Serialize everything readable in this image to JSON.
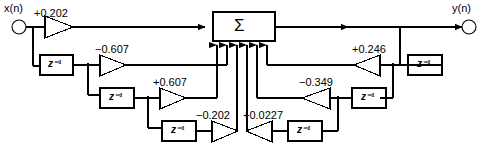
{
  "diagram": {
    "type": "signal-flow-graph",
    "stroke_color": "#000000",
    "background": "#ffffff",
    "summation_symbol": "Σ",
    "delay_label": "z⁻¹",
    "input_label": "x(n)",
    "output_label": "y(n)",
    "feedforward_coefficients": [
      "+0.202",
      "-0.607",
      "+0.607",
      "-0.202"
    ],
    "feedback_coefficients": [
      "+0.246",
      "-0.349",
      "+0.0227"
    ],
    "summation_input_count": 7,
    "delay_count": 6
  },
  "nodes": {
    "input": {
      "name": "x(n)",
      "label": "x(n)"
    },
    "output": {
      "name": "y(n)",
      "label": "y(n)"
    },
    "adder": {
      "label": "Σ"
    }
  },
  "gains": [
    {
      "id": "g1",
      "label": "+0.202",
      "value": 0.202,
      "direction": "right",
      "path": "feedforward"
    },
    {
      "id": "g2",
      "label": "−0.607",
      "value": -0.607,
      "direction": "right",
      "path": "feedforward"
    },
    {
      "id": "g3",
      "label": "+0.607",
      "value": 0.607,
      "direction": "right",
      "path": "feedforward"
    },
    {
      "id": "g4",
      "label": "−0.202",
      "value": -0.202,
      "direction": "right",
      "path": "feedforward"
    },
    {
      "id": "g5",
      "label": "+0.246",
      "value": 0.246,
      "direction": "left",
      "path": "feedback"
    },
    {
      "id": "g6",
      "label": "−0.349",
      "value": -0.349,
      "direction": "left",
      "path": "feedback"
    },
    {
      "id": "g7",
      "label": "+0.0227",
      "value": 0.0227,
      "direction": "left",
      "path": "feedback"
    }
  ],
  "delays": [
    {
      "id": "d1",
      "label": "z⁻¹",
      "path": "feedforward"
    },
    {
      "id": "d2",
      "label": "z⁻¹",
      "path": "feedforward"
    },
    {
      "id": "d3",
      "label": "z⁻¹",
      "path": "feedforward"
    },
    {
      "id": "d4",
      "label": "z⁻¹",
      "path": "feedback"
    },
    {
      "id": "d5",
      "label": "z⁻¹",
      "path": "feedback"
    },
    {
      "id": "d6",
      "label": "z⁻¹",
      "path": "feedback"
    }
  ]
}
